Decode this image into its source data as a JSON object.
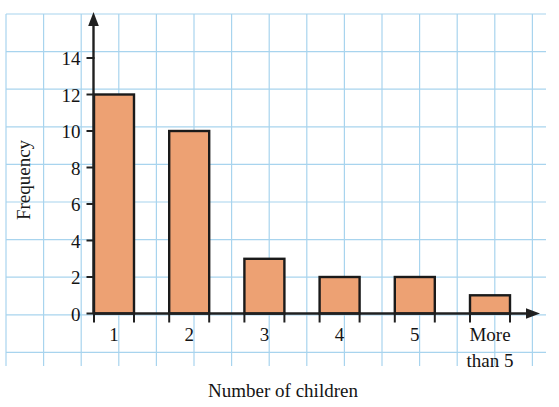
{
  "chart_data": {
    "type": "bar",
    "title": "",
    "xlabel": "Number of children",
    "ylabel": "Frequency",
    "categories": [
      "1",
      "2",
      "3",
      "4",
      "5",
      "More than 5"
    ],
    "values": [
      12,
      10,
      3,
      2,
      2,
      1
    ],
    "ylim": [
      0,
      15
    ],
    "ytick_labels": [
      "0",
      "2",
      "4",
      "6",
      "8",
      "10",
      "12",
      "14"
    ],
    "ytick_values": [
      0,
      2,
      4,
      6,
      8,
      10,
      12,
      14
    ],
    "grid": true,
    "legend": "none",
    "bar_fill_color": "#eda173",
    "bar_edge_color": "#1a1a1a",
    "grid_color": "#a8d4ee",
    "axis_color": "#202020",
    "background_color": "#ffffff"
  },
  "axes": {
    "y_title": "Frequency",
    "x_title": "Number of children"
  },
  "bars": [
    {
      "label": "1",
      "label_line2": "",
      "value": 12
    },
    {
      "label": "2",
      "label_line2": "",
      "value": 10
    },
    {
      "label": "3",
      "label_line2": "",
      "value": 3
    },
    {
      "label": "4",
      "label_line2": "",
      "value": 2
    },
    {
      "label": "5",
      "label_line2": "",
      "value": 2
    },
    {
      "label": "More",
      "label_line2": "than 5",
      "value": 1
    }
  ],
  "yticks": [
    {
      "label": "14",
      "value": 14
    },
    {
      "label": "12",
      "value": 12
    },
    {
      "label": "10",
      "value": 10
    },
    {
      "label": "8",
      "value": 8
    },
    {
      "label": "6",
      "value": 6
    },
    {
      "label": "4",
      "value": 4
    },
    {
      "label": "2",
      "value": 2
    },
    {
      "label": "0",
      "value": 0
    }
  ]
}
